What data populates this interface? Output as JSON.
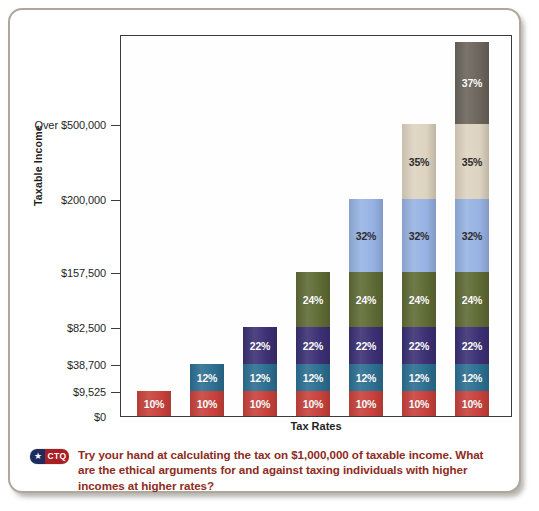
{
  "figure": {
    "frame_border_color": "#b0a79b",
    "background_color": "#ffffff"
  },
  "chart_data": {
    "type": "bar",
    "subtype": "stacked-bar",
    "title": "",
    "xlabel": "Tax Rates",
    "ylabel": "Taxable Income",
    "grid": false,
    "legend_position": "none",
    "categories": [
      "Bracket 1",
      "Bracket 2",
      "Bracket 3",
      "Bracket 4",
      "Bracket 5",
      "Bracket 6",
      "Bracket 7"
    ],
    "y_tick_labels": [
      "$0",
      "$9,525",
      "$38,700",
      "$82,500",
      "$157,500",
      "$200,000",
      "Over $500,000"
    ],
    "y_tick_values": [
      0,
      9525,
      38700,
      82500,
      157500,
      200000,
      500000
    ],
    "y_tick_pixel_top": [
      407,
      382,
      355,
      318,
      263,
      190,
      115
    ],
    "ylim": [
      0,
      600000
    ],
    "segment_rates": [
      "10%",
      "12%",
      "22%",
      "24%",
      "32%",
      "35%",
      "37%"
    ],
    "segment_colors": [
      "#c9413c",
      "#2c6f91",
      "#3c3075",
      "#5f6b35",
      "#97b2e3",
      "#ddd3c0",
      "#6b655c"
    ],
    "segment_label_colors": [
      "#ffffff",
      "#ffffff",
      "#ffffff",
      "#ffffff",
      "#2c2c2c",
      "#2c2c2c",
      "#ffffff"
    ],
    "bars": [
      {
        "index": 0,
        "segments": [
          {
            "rate": "10%",
            "height_px": 25
          }
        ]
      },
      {
        "index": 1,
        "segments": [
          {
            "rate": "10%",
            "height_px": 25
          },
          {
            "rate": "12%",
            "height_px": 27
          }
        ]
      },
      {
        "index": 2,
        "segments": [
          {
            "rate": "10%",
            "height_px": 25
          },
          {
            "rate": "12%",
            "height_px": 27
          },
          {
            "rate": "22%",
            "height_px": 37
          }
        ]
      },
      {
        "index": 3,
        "segments": [
          {
            "rate": "10%",
            "height_px": 25
          },
          {
            "rate": "12%",
            "height_px": 27
          },
          {
            "rate": "22%",
            "height_px": 37
          },
          {
            "rate": "24%",
            "height_px": 55
          }
        ]
      },
      {
        "index": 4,
        "segments": [
          {
            "rate": "10%",
            "height_px": 25
          },
          {
            "rate": "12%",
            "height_px": 27
          },
          {
            "rate": "22%",
            "height_px": 37
          },
          {
            "rate": "24%",
            "height_px": 55
          },
          {
            "rate": "32%",
            "height_px": 73
          }
        ]
      },
      {
        "index": 5,
        "segments": [
          {
            "rate": "10%",
            "height_px": 25
          },
          {
            "rate": "12%",
            "height_px": 27
          },
          {
            "rate": "22%",
            "height_px": 37
          },
          {
            "rate": "24%",
            "height_px": 55
          },
          {
            "rate": "32%",
            "height_px": 73
          },
          {
            "rate": "35%",
            "height_px": 75
          }
        ]
      },
      {
        "index": 6,
        "segments": [
          {
            "rate": "10%",
            "height_px": 25
          },
          {
            "rate": "12%",
            "height_px": 27
          },
          {
            "rate": "22%",
            "height_px": 37
          },
          {
            "rate": "24%",
            "height_px": 55
          },
          {
            "rate": "32%",
            "height_px": 73
          },
          {
            "rate": "35%",
            "height_px": 75
          },
          {
            "rate": "37%",
            "height_px": 82
          }
        ]
      }
    ]
  },
  "ctq": {
    "badge_star": "★",
    "badge_label": "CTQ",
    "badge_navy": "#1d2c5c",
    "badge_red": "#a81f23",
    "text_color": "#8e2b22",
    "text": "Try your hand at calculating the tax on $1,000,000 of taxable income. What are the ethical arguments for and against taxing individuals with higher incomes at higher rates?"
  }
}
